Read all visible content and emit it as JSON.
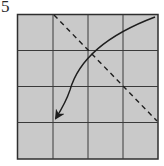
{
  "step": {
    "number": "5"
  },
  "diagram": {
    "type": "folding-instruction",
    "grid": {
      "rows": 4,
      "cols": 4
    },
    "colors": {
      "paper": "#c9c9c9",
      "line": "#3a3a3a",
      "border": "#2e2e2e",
      "arrow": "#1e1e1e"
    },
    "fold_line": {
      "style": "dashed",
      "from": "top edge, 1/4 from left",
      "to": "right edge, 3/4 from top"
    },
    "arrow": {
      "style": "curved",
      "from": "top-right corner",
      "to": "grid point col 1, row 3"
    }
  }
}
